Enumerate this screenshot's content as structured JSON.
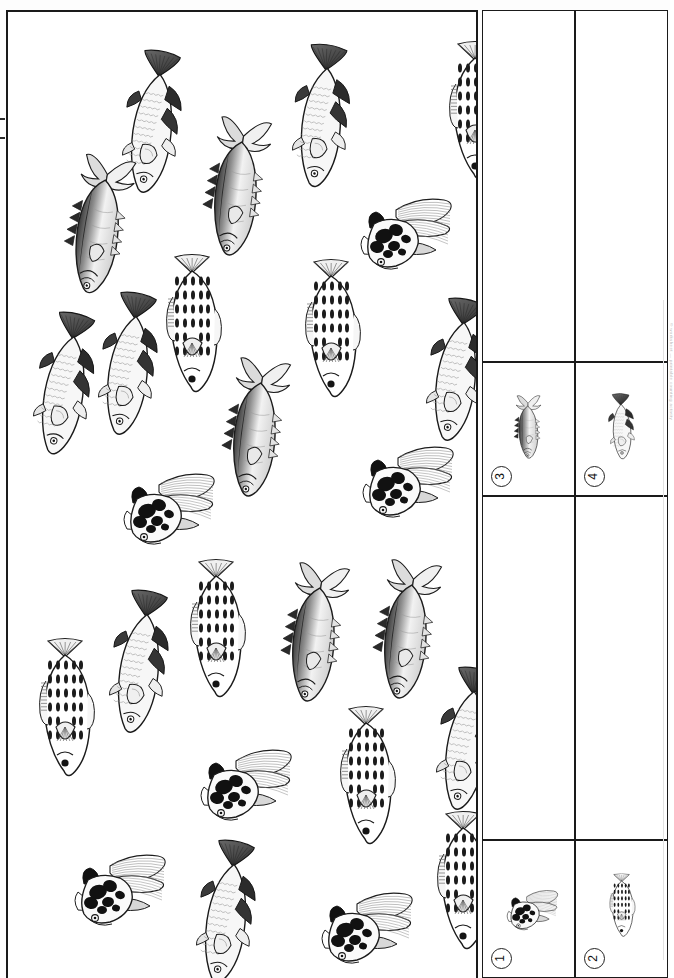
{
  "worksheet": {
    "title": "Fish counting worksheet",
    "orientation": "rotated-90",
    "panel_label": "main-counting-panel"
  },
  "legend": {
    "label": "fish-key",
    "items": [
      {
        "number": "1",
        "species_id": 1,
        "name": "black-and-white-koi",
        "description": "butterfly koi with long flowing fins and black blotches"
      },
      {
        "number": "2",
        "species_id": 2,
        "name": "speckled-fan-tail-fish",
        "description": "oval pale fish with dark oval speckles and fan tail"
      },
      {
        "number": "3",
        "species_id": 3,
        "name": "spiny-tuna",
        "description": "tuna shaped fish with crescent tail and spiky finlets"
      },
      {
        "number": "4",
        "species_id": 4,
        "name": "dark-finned-trout",
        "description": "slender trout with dark fan tail and dark dorsal fins"
      }
    ]
  },
  "answer_cells": [
    {
      "name": "answer-cell-3",
      "column": 1,
      "value": ""
    },
    {
      "name": "answer-cell-4",
      "column": 2,
      "value": ""
    },
    {
      "name": "answer-cell-1",
      "column": 1,
      "value": ""
    },
    {
      "name": "answer-cell-2",
      "column": 2,
      "value": ""
    }
  ],
  "margin_note": "©  worksheet  —  printable  counting  activity",
  "chart_data": {
    "type": "table",
    "categories": [
      "1",
      "2",
      "3",
      "4"
    ],
    "series": [
      {
        "name": "count",
        "values": [
          6,
          7,
          5,
          9
        ]
      }
    ],
    "legend_names": [
      "black-and-white-koi",
      "speckled-fan-tail-fish",
      "spiny-tuna",
      "dark-finned-trout"
    ],
    "total": 27,
    "xlabel": "fish type",
    "ylabel": "count",
    "grid": false,
    "legend_position": "right"
  },
  "school": {
    "name": "fish-school",
    "fish": [
      {
        "species": 4,
        "x": 108,
        "y": 38,
        "rot": 10,
        "scale": 1.0
      },
      {
        "species": 4,
        "x": 277,
        "y": 32,
        "rot": 8,
        "scale": 1.0
      },
      {
        "species": 2,
        "x": 434,
        "y": 30,
        "rot": 0,
        "scale": 1.0
      },
      {
        "species": 3,
        "x": 194,
        "y": 102,
        "rot": 8,
        "scale": 1.0
      },
      {
        "species": 3,
        "x": 56,
        "y": 140,
        "rot": 10,
        "scale": 1.0
      },
      {
        "species": 1,
        "x": 336,
        "y": 172,
        "rot": 0,
        "scale": 1.0
      },
      {
        "species": 4,
        "x": 20,
        "y": 300,
        "rot": 12,
        "scale": 1.0
      },
      {
        "species": 4,
        "x": 84,
        "y": 280,
        "rot": 10,
        "scale": 1.0
      },
      {
        "species": 2,
        "x": 151,
        "y": 243,
        "rot": 0,
        "scale": 1.0
      },
      {
        "species": 2,
        "x": 290,
        "y": 248,
        "rot": 0,
        "scale": 1.0
      },
      {
        "species": 4,
        "x": 412,
        "y": 286,
        "rot": 10,
        "scale": 1.0
      },
      {
        "species": 3,
        "x": 213,
        "y": 343,
        "rot": 8,
        "scale": 1.0
      },
      {
        "species": 1,
        "x": 338,
        "y": 420,
        "rot": 0,
        "scale": 1.0
      },
      {
        "species": 1,
        "x": 99,
        "y": 447,
        "rot": 0,
        "scale": 1.0
      },
      {
        "species": 2,
        "x": 175,
        "y": 548,
        "rot": 0,
        "scale": 1.0
      },
      {
        "species": 3,
        "x": 272,
        "y": 548,
        "rot": 8,
        "scale": 1.0
      },
      {
        "species": 3,
        "x": 364,
        "y": 545,
        "rot": 8,
        "scale": 1.0
      },
      {
        "species": 4,
        "x": 95,
        "y": 578,
        "rot": 10,
        "scale": 1.0
      },
      {
        "species": 2,
        "x": 24,
        "y": 627,
        "rot": 0,
        "scale": 1.0
      },
      {
        "species": 2,
        "x": 325,
        "y": 695,
        "rot": 0,
        "scale": 1.0
      },
      {
        "species": 4,
        "x": 422,
        "y": 655,
        "rot": 10,
        "scale": 1.0
      },
      {
        "species": 1,
        "x": 176,
        "y": 723,
        "rot": 0,
        "scale": 1.0
      },
      {
        "species": 1,
        "x": 50,
        "y": 828,
        "rot": 0,
        "scale": 1.0
      },
      {
        "species": 4,
        "x": 182,
        "y": 828,
        "rot": 10,
        "scale": 1.0
      },
      {
        "species": 1,
        "x": 297,
        "y": 866,
        "rot": 0,
        "scale": 1.0
      },
      {
        "species": 2,
        "x": 422,
        "y": 800,
        "rot": 0,
        "scale": 1.0
      }
    ]
  }
}
